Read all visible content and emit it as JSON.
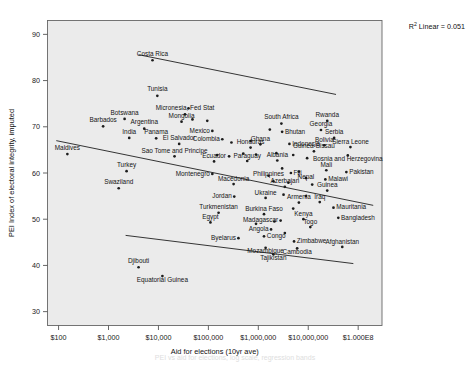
{
  "chart_data": {
    "type": "scatter",
    "title": "",
    "xlabel": "Aid for elections (10yr ave)",
    "ylabel": "PEI Index of electoral integrity, imputed",
    "annotation": "R² Linear = 0.051",
    "annotation_prefix": "R",
    "annotation_exponent": "2",
    "annotation_suffix": " Linear = 0.051",
    "grid": false,
    "legend": "none",
    "x_scale": "log10",
    "xlim": [
      60,
      300000000
    ],
    "ylim": [
      27,
      93
    ],
    "xticks": [
      {
        "value": 100,
        "label": "$100"
      },
      {
        "value": 1000,
        "label": "$1,000"
      },
      {
        "value": 10000,
        "label": "$10,000"
      },
      {
        "value": 100000,
        "label": "$100,000"
      },
      {
        "value": 1000000,
        "label": "$1,000,000"
      },
      {
        "value": 10000000,
        "label": "$10,000,000"
      },
      {
        "value": 100000000,
        "label": "$1.000E8"
      }
    ],
    "yticks": [
      {
        "value": 30,
        "label": "30"
      },
      {
        "value": 40,
        "label": "40"
      },
      {
        "value": 50,
        "label": "50"
      },
      {
        "value": 60,
        "label": "60"
      },
      {
        "value": 70,
        "label": "70"
      },
      {
        "value": 80,
        "label": "80"
      },
      {
        "value": 90,
        "label": "90"
      }
    ],
    "fit_lines": [
      {
        "name": "upper-fit-line",
        "x1": 4000,
        "y1": 85.6,
        "x2": 36000000,
        "y2": 77.0
      },
      {
        "name": "middle-fit-line",
        "x1": 90,
        "y1": 67.0,
        "x2": 200000000,
        "y2": 53.0
      },
      {
        "name": "lower-fit-line",
        "x1": 2200,
        "y1": 46.5,
        "x2": 80000000,
        "y2": 40.4
      }
    ],
    "points": [
      {
        "label": "Costa Rica",
        "x": 7600,
        "y": 84.4,
        "lx": 0,
        "ly": -4.5,
        "anchor": "middle"
      },
      {
        "label": "Tunisia",
        "x": 9500,
        "y": 76.7,
        "lx": 0,
        "ly": -4.5,
        "anchor": "middle"
      },
      {
        "label": "Micronesia, Fed Stat",
        "x": 34000,
        "y": 72.7,
        "lx": 0,
        "ly": -4.2,
        "anchor": "middle"
      },
      {
        "label": "Botswana",
        "x": 2100,
        "y": 71.7,
        "lx": 0,
        "ly": -4.2,
        "anchor": "middle"
      },
      {
        "label": "Mongolia",
        "x": 29000,
        "y": 71.1,
        "lx": 0,
        "ly": -4.2,
        "anchor": "middle"
      },
      {
        "label": "South Africa",
        "x": 2900000,
        "y": 70.7,
        "lx": 0,
        "ly": -4.2,
        "anchor": "middle"
      },
      {
        "label": "Rwanda",
        "x": 24000000,
        "y": 71.3,
        "lx": 0,
        "ly": -4.2,
        "anchor": "middle"
      },
      {
        "label": "Barbados",
        "x": 780,
        "y": 70.1,
        "lx": 0,
        "ly": -4.2,
        "anchor": "middle"
      },
      {
        "label": "Argentina",
        "x": 5200,
        "y": 69.6,
        "lx": 0,
        "ly": -4.2,
        "anchor": "middle"
      },
      {
        "label": "Mexico",
        "x": 120000,
        "y": 69.1,
        "lx": -2.5,
        "ly": 1.8,
        "anchor": "end"
      },
      {
        "label": "Bhutan",
        "x": 3000000,
        "y": 68.9,
        "lx": 2.8,
        "ly": 1.8,
        "anchor": "start"
      },
      {
        "label": "Georgia",
        "x": 18000000,
        "y": 69.3,
        "lx": 0,
        "ly": -3.6,
        "anchor": "middle"
      },
      {
        "label": "Serbia",
        "x": 33000000,
        "y": 67.6,
        "lx": 0,
        "ly": -3.6,
        "anchor": "middle"
      },
      {
        "label": "India",
        "x": 2600,
        "y": 67.6,
        "lx": 0,
        "ly": -4.2,
        "anchor": "middle"
      },
      {
        "label": "Panama",
        "x": 9000,
        "y": 67.5,
        "lx": 0,
        "ly": -4.2,
        "anchor": "middle"
      },
      {
        "label": "Colombia",
        "x": 190000,
        "y": 67.3,
        "lx": -2.5,
        "ly": 1.8,
        "anchor": "end"
      },
      {
        "label": "Ghana",
        "x": 1100000,
        "y": 66.2,
        "lx": 0,
        "ly": -3.6,
        "anchor": "middle"
      },
      {
        "label": "Indonesia",
        "x": 4200000,
        "y": 66.3,
        "lx": 2.8,
        "ly": 1.8,
        "anchor": "start"
      },
      {
        "label": "Bolivia",
        "x": 21000000,
        "y": 66.0,
        "lx": 0,
        "ly": -3.4,
        "anchor": "middle"
      },
      {
        "label": "Sierra Leone",
        "x": 70000000,
        "y": 65.6,
        "lx": 0,
        "ly": -3.4,
        "anchor": "middle"
      },
      {
        "label": "El Salvador",
        "x": 26000,
        "y": 66.3,
        "lx": 0,
        "ly": -4.2,
        "anchor": "middle"
      },
      {
        "label": "Honduras",
        "x": 700000,
        "y": 65.5,
        "lx": 0,
        "ly": -3.4,
        "anchor": "middle"
      },
      {
        "label": "Guinea-Bissau",
        "x": 13000000,
        "y": 64.7,
        "lx": 0,
        "ly": -3.4,
        "anchor": "middle"
      },
      {
        "label": "Bosnia and Herzegovina",
        "x": 62000000,
        "y": 63.8,
        "lx": 0,
        "ly": 5.4,
        "anchor": "middle"
      },
      {
        "label": "Maldives",
        "x": 150,
        "y": 64.1,
        "lx": 0,
        "ly": -3.6,
        "anchor": "middle"
      },
      {
        "label": "Sao Tome and Principe",
        "x": 21000,
        "y": 63.6,
        "lx": 0,
        "ly": -3.6,
        "anchor": "middle"
      },
      {
        "label": "Ecuador",
        "x": 130000,
        "y": 62.5,
        "lx": 0,
        "ly": -3.4,
        "anchor": "middle"
      },
      {
        "label": "Paraguay",
        "x": 600000,
        "y": 62.6,
        "lx": 0,
        "ly": -3.4,
        "anchor": "middle"
      },
      {
        "label": "Albania",
        "x": 2400000,
        "y": 62.7,
        "lx": 0,
        "ly": -3.4,
        "anchor": "middle"
      },
      {
        "label": "Fiji",
        "x": 4500000,
        "y": 60.0,
        "lx": 2.6,
        "ly": 1.8,
        "anchor": "start"
      },
      {
        "label": "Mali",
        "x": 23000000,
        "y": 60.6,
        "lx": 0,
        "ly": -3.4,
        "anchor": "middle"
      },
      {
        "label": "Pakistan",
        "x": 58000000,
        "y": 60.2,
        "lx": 2.8,
        "ly": 1.8,
        "anchor": "start"
      },
      {
        "label": "Turkey",
        "x": 2300,
        "y": 60.4,
        "lx": 0,
        "ly": -4.2,
        "anchor": "middle"
      },
      {
        "label": "Montenegro",
        "x": 120000,
        "y": 59.8,
        "lx": -2.5,
        "ly": 1.8,
        "anchor": "end"
      },
      {
        "label": "Philippines",
        "x": 1600000,
        "y": 59.4,
        "lx": 0,
        "ly": 0.6,
        "anchor": "middle"
      },
      {
        "label": "Nepal",
        "x": 9000000,
        "y": 58.9,
        "lx": 0,
        "ly": 0.8,
        "anchor": "middle"
      },
      {
        "label": "Malawi",
        "x": 22000000,
        "y": 58.6,
        "lx": 2.8,
        "ly": 1.8,
        "anchor": "start"
      },
      {
        "label": "Macedonia",
        "x": 320000,
        "y": 57.6,
        "lx": 0,
        "ly": -3.4,
        "anchor": "middle"
      },
      {
        "label": "Azerbajan",
        "x": 3400000,
        "y": 57.0,
        "lx": 0,
        "ly": -3.4,
        "anchor": "middle"
      },
      {
        "label": "Swaziland",
        "x": 1600,
        "y": 56.7,
        "lx": 0,
        "ly": -4.2,
        "anchor": "middle"
      },
      {
        "label": "Guinea",
        "x": 24000000,
        "y": 56.2,
        "lx": 0,
        "ly": -3.2,
        "anchor": "middle"
      },
      {
        "label": "Jordan",
        "x": 330000,
        "y": 54.9,
        "lx": -2.5,
        "ly": 1.6,
        "anchor": "end"
      },
      {
        "label": "Ukraine",
        "x": 1400000,
        "y": 54.6,
        "lx": 0,
        "ly": -3.2,
        "anchor": "middle"
      },
      {
        "label": "Armenia",
        "x": 6500000,
        "y": 53.6,
        "lx": 0,
        "ly": -3.2,
        "anchor": "middle"
      },
      {
        "label": "Iraq",
        "x": 17000000,
        "y": 53.7,
        "lx": 0,
        "ly": -3.2,
        "anchor": "middle"
      },
      {
        "label": "Turkmenistan",
        "x": 160000,
        "y": 51.4,
        "lx": 0,
        "ly": -3.4,
        "anchor": "middle"
      },
      {
        "label": "Burkina Faso",
        "x": 1300000,
        "y": 51.1,
        "lx": 0,
        "ly": -3.2,
        "anchor": "middle"
      },
      {
        "label": "Mauritania",
        "x": 32000000,
        "y": 52.5,
        "lx": 2.8,
        "ly": 1.8,
        "anchor": "start"
      },
      {
        "label": "Kenya",
        "x": 8000000,
        "y": 50.0,
        "lx": 0,
        "ly": -3.2,
        "anchor": "middle"
      },
      {
        "label": "Bangladesh",
        "x": 40000000,
        "y": 50.3,
        "lx": 2.8,
        "ly": 1.8,
        "anchor": "start"
      },
      {
        "label": "Madagascar",
        "x": 2800000,
        "y": 49.7,
        "lx": -2.5,
        "ly": 1.8,
        "anchor": "end"
      },
      {
        "label": "Egypt",
        "x": 110000,
        "y": 49.3,
        "lx": 0,
        "ly": -3.4,
        "anchor": "middle"
      },
      {
        "label": "Togo",
        "x": 11000000,
        "y": 48.3,
        "lx": 0,
        "ly": -3.2,
        "anchor": "middle"
      },
      {
        "label": "Angola",
        "x": 1800000,
        "y": 47.8,
        "lx": -2.5,
        "ly": 1.8,
        "anchor": "end"
      },
      {
        "label": "Byelarus",
        "x": 400000,
        "y": 45.9,
        "lx": -2.5,
        "ly": 1.8,
        "anchor": "end"
      },
      {
        "label": "Congo",
        "x": 1300000,
        "y": 46.3,
        "lx": 2.8,
        "ly": 1.2,
        "anchor": "start"
      },
      {
        "label": "Zimbabwe",
        "x": 5200000,
        "y": 45.2,
        "lx": 2.8,
        "ly": 1.8,
        "anchor": "start"
      },
      {
        "label": "Afghanistan",
        "x": 48000000,
        "y": 44.0,
        "lx": 0,
        "ly": -3.2,
        "anchor": "middle"
      },
      {
        "label": "Mozambique",
        "x": 1400000,
        "y": 43.8,
        "lx": 0,
        "ly": 5.2,
        "anchor": "middle"
      },
      {
        "label": "Cambodia",
        "x": 6000000,
        "y": 43.7,
        "lx": 0,
        "ly": 5.2,
        "anchor": "middle"
      },
      {
        "label": "Tajikistan",
        "x": 2000000,
        "y": 42.4,
        "lx": 0,
        "ly": 5.2,
        "anchor": "middle"
      },
      {
        "label": "Djibouti",
        "x": 4000,
        "y": 39.6,
        "lx": 0,
        "ly": -4.0,
        "anchor": "middle"
      },
      {
        "label": "Equatorial Guinea",
        "x": 12000,
        "y": 37.7,
        "lx": 0,
        "ly": 6.4,
        "anchor": "middle"
      },
      {
        "label": "",
        "x": 40000,
        "y": 74.0,
        "lx": 0,
        "ly": 0,
        "anchor": "middle"
      },
      {
        "label": "",
        "x": 48000,
        "y": 71.6,
        "lx": 0,
        "ly": 0,
        "anchor": "middle"
      },
      {
        "label": "",
        "x": 95000,
        "y": 71.3,
        "lx": 0,
        "ly": 0,
        "anchor": "middle"
      },
      {
        "label": "",
        "x": 1700000,
        "y": 69.4,
        "lx": 0,
        "ly": 0,
        "anchor": "middle"
      },
      {
        "label": "",
        "x": 700000,
        "y": 66.9,
        "lx": 0,
        "ly": 0,
        "anchor": "middle"
      },
      {
        "label": "",
        "x": 290000,
        "y": 66.6,
        "lx": 0,
        "ly": 0,
        "anchor": "middle"
      },
      {
        "label": "",
        "x": 500000,
        "y": 64.2,
        "lx": 0,
        "ly": 0,
        "anchor": "middle"
      },
      {
        "label": "",
        "x": 900000,
        "y": 64.0,
        "lx": 0,
        "ly": 0,
        "anchor": "middle"
      },
      {
        "label": "",
        "x": 2300000,
        "y": 64.3,
        "lx": 0,
        "ly": 0,
        "anchor": "middle"
      },
      {
        "label": "",
        "x": 5000000,
        "y": 63.9,
        "lx": 0,
        "ly": 0,
        "anchor": "middle"
      },
      {
        "label": "",
        "x": 9500000,
        "y": 63.2,
        "lx": 0,
        "ly": 0,
        "anchor": "middle"
      },
      {
        "label": "",
        "x": 150000,
        "y": 63.9,
        "lx": 0,
        "ly": 0,
        "anchor": "middle"
      },
      {
        "label": "",
        "x": 260000,
        "y": 63.6,
        "lx": 0,
        "ly": 0,
        "anchor": "middle"
      },
      {
        "label": "",
        "x": 3000000,
        "y": 61.0,
        "lx": 0,
        "ly": 0,
        "anchor": "middle"
      },
      {
        "label": "",
        "x": 6500000,
        "y": 60.3,
        "lx": 0,
        "ly": 0,
        "anchor": "middle"
      },
      {
        "label": "",
        "x": 2000000,
        "y": 58.2,
        "lx": 0,
        "ly": 0,
        "anchor": "middle"
      },
      {
        "label": "",
        "x": 4000000,
        "y": 57.9,
        "lx": 0,
        "ly": 0,
        "anchor": "middle"
      },
      {
        "label": "",
        "x": 12000000,
        "y": 57.5,
        "lx": 0,
        "ly": 0,
        "anchor": "middle"
      },
      {
        "label": "",
        "x": 3200000,
        "y": 55.3,
        "lx": 0,
        "ly": 0,
        "anchor": "middle"
      },
      {
        "label": "",
        "x": 9000000,
        "y": 55.0,
        "lx": 0,
        "ly": 0,
        "anchor": "middle"
      },
      {
        "label": "",
        "x": 5000000,
        "y": 52.3,
        "lx": 0,
        "ly": 0,
        "anchor": "middle"
      },
      {
        "label": "",
        "x": 2100000,
        "y": 49.5,
        "lx": 0,
        "ly": 0,
        "anchor": "middle"
      },
      {
        "label": "",
        "x": 900000,
        "y": 49.0,
        "lx": 0,
        "ly": 0,
        "anchor": "middle"
      },
      {
        "label": "",
        "x": 3400000,
        "y": 47.0,
        "lx": 0,
        "ly": 0,
        "anchor": "middle"
      }
    ]
  },
  "caption": {
    "text": "PEI vs aid for elections, log scale, regression bands"
  }
}
